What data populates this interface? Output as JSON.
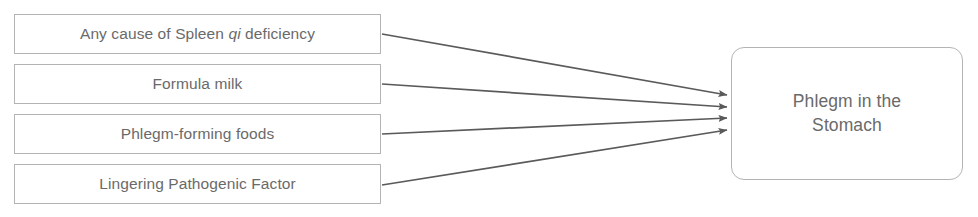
{
  "diagram": {
    "type": "causal-flow",
    "background_color": "#ffffff",
    "box_border_color": "#b4b4b4",
    "text_color": "#6a6a6a",
    "arrow_color": "#5a5a5a",
    "causes": [
      {
        "id": "spleen-qi-deficiency",
        "label_before": "Any cause of Spleen ",
        "label_italic": "qi",
        "label_after": " deficiency"
      },
      {
        "id": "formula-milk",
        "label_before": "Formula milk",
        "label_italic": "",
        "label_after": ""
      },
      {
        "id": "phlegm-forming-foods",
        "label_before": "Phlegm-forming foods",
        "label_italic": "",
        "label_after": ""
      },
      {
        "id": "lingering-pathogenic-factor",
        "label_before": "Lingering Pathogenic Factor",
        "label_italic": "",
        "label_after": ""
      }
    ],
    "effect": {
      "id": "phlegm-in-the-stomach",
      "line_1": "Phlegm in the",
      "line_2": "Stomach"
    },
    "arrows": [
      {
        "from": "spleen-qi-deficiency",
        "to": "phlegm-in-the-stomach"
      },
      {
        "from": "formula-milk",
        "to": "phlegm-in-the-stomach"
      },
      {
        "from": "phlegm-forming-foods",
        "to": "phlegm-in-the-stomach"
      },
      {
        "from": "lingering-pathogenic-factor",
        "to": "phlegm-in-the-stomach"
      }
    ]
  }
}
